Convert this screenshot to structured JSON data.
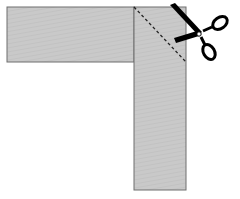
{
  "diagram": {
    "colors": {
      "background": "#ffffff",
      "strip_fill": "#c8c8c8",
      "strip_stroke": "#6e6e6e",
      "cut_line": "#222222",
      "scissors": "#000000"
    },
    "horizontal_strip": {
      "x": 7,
      "y": 7,
      "width": 127,
      "height": 55
    },
    "vertical_strip": {
      "x": 134,
      "y": 7,
      "width": 52,
      "height": 183
    },
    "cut_line": {
      "x1": 134,
      "y1": 7,
      "x2": 186,
      "y2": 62,
      "style": "dashed"
    },
    "icons": [
      "scissors-icon"
    ]
  }
}
